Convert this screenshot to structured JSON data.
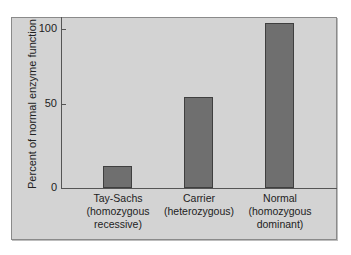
{
  "chart_data": {
    "type": "bar",
    "title": "",
    "xlabel": "",
    "ylabel": "Percent of normal enzyme function",
    "ylim": [
      0,
      105
    ],
    "yticks": [
      0,
      50,
      100
    ],
    "grid": false,
    "categories": [
      [
        "Tay-Sachs",
        "(homozygous",
        "recessive)"
      ],
      [
        "Carrier",
        "(heterozygous)",
        ""
      ],
      [
        "Normal",
        "(homozygous",
        "dominant)"
      ]
    ],
    "category_names": [
      "Tay-Sachs (homozygous recessive)",
      "Carrier (heterozygous)",
      "Normal (homozygous dominant)"
    ],
    "values": [
      14,
      57,
      104
    ],
    "colors": {
      "bar": "#6f6f6f",
      "panel": "#d3d3d3"
    }
  },
  "axis": {
    "tick_labels": [
      "0",
      "50",
      "100"
    ]
  }
}
